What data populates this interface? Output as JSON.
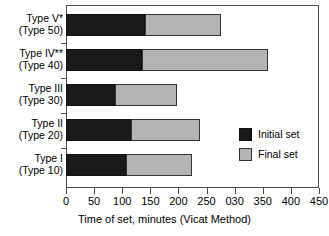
{
  "chart_data": {
    "type": "bar",
    "orientation": "horizontal",
    "stacked": true,
    "title": "",
    "xlabel": "Time of set, minutes (Vicat Method)",
    "ylabel": "",
    "xlim": [
      0,
      450
    ],
    "xticks": [
      0,
      50,
      100,
      150,
      200,
      250,
      300,
      350,
      400,
      450
    ],
    "xtick_labels": [
      "0",
      "50",
      "100",
      "150",
      "200",
      "250",
      "030",
      "350",
      "400",
      "450"
    ],
    "grid": false,
    "legend_position": "right-middle",
    "categories": [
      "Type V* (Type 50)",
      "Type IV** (Type 40)",
      "Type III (Type 30)",
      "Type II (Type 20)",
      "Type I (Type 10)"
    ],
    "category_labels": [
      {
        "line1": "Type V*",
        "line2": "(Type 50)"
      },
      {
        "line1": "Type IV**",
        "line2": "(Type 40)"
      },
      {
        "line1": "Type III",
        "line2": "(Type 30)"
      },
      {
        "line1": "Type II",
        "line2": "(Type 20)"
      },
      {
        "line1": "Type I",
        "line2": "(Type 10)"
      }
    ],
    "series": [
      {
        "name": "Initial set",
        "color": "#1a1a1a",
        "values": [
          140,
          135,
          88,
          115,
          107
        ]
      },
      {
        "name": "Final set",
        "color": "#b3b3b3",
        "values": [
          275,
          360,
          198,
          238,
          225
        ]
      }
    ]
  },
  "legend": {
    "entries": [
      {
        "label": "Initial set",
        "swatch": "initial"
      },
      {
        "label": "Final set",
        "swatch": "final"
      }
    ]
  }
}
